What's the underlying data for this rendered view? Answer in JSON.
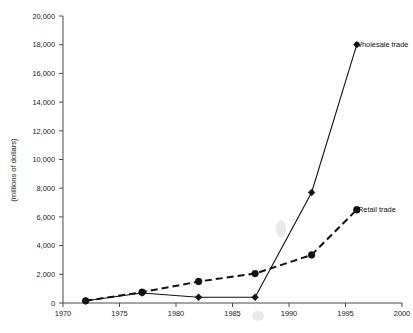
{
  "chart_data": {
    "type": "line",
    "title": "",
    "subtitle": "",
    "xlabel": "",
    "ylabel": "(millions of dollars)",
    "xlim": [
      1970,
      2000
    ],
    "ylim": [
      0,
      20000
    ],
    "x_ticks": [
      1970,
      1975,
      1980,
      1985,
      1990,
      1995,
      2000
    ],
    "x_tick_labels": [
      "1970",
      "1975",
      "1980",
      "1985",
      "1990",
      "1995",
      "2000"
    ],
    "y_ticks": [
      0,
      2000,
      4000,
      6000,
      8000,
      10000,
      12000,
      14000,
      16000,
      18000,
      20000
    ],
    "y_tick_labels": [
      "0",
      "2,000",
      "4,000",
      "6,000",
      "8,000",
      "10,000",
      "12,000",
      "14,000",
      "16,000",
      "18,000",
      "20,000"
    ],
    "grid": false,
    "legend_position": "inline-right-of-endpoint",
    "x": [
      1972,
      1977,
      1982,
      1987,
      1992,
      1996
    ],
    "series": [
      {
        "name": "Wholesale trade",
        "style": "solid",
        "marker": "diamond",
        "values": [
          150,
          700,
          400,
          400,
          7700,
          18000
        ]
      },
      {
        "name": "Retail trade",
        "style": "dashed",
        "marker": "circle",
        "values": [
          150,
          750,
          1500,
          2050,
          3350,
          6500
        ]
      }
    ]
  },
  "labels": {
    "wholesale": "Wholesale trade",
    "retail": "Retail trade",
    "y_axis_title": "(millions of dollars)"
  },
  "colors": {
    "line": "#111111",
    "axis": "#4a4a4a",
    "text": "#1a1a1a",
    "background": "#ffffff"
  }
}
